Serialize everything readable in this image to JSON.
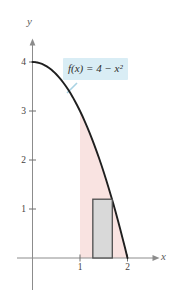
{
  "figure": {
    "function_label": "f(x) = 4 − x²",
    "axis_labels": {
      "x": "x",
      "y": "y"
    }
  },
  "chart_data": {
    "type": "line",
    "title": "",
    "xlabel": "x",
    "ylabel": "y",
    "function_label": "f(x) = 4 − x²",
    "function_coefficients": {
      "a": -1,
      "b": 0,
      "c": 4
    },
    "curve_domain": [
      0,
      2
    ],
    "curve_points": [
      [
        0,
        4
      ],
      [
        0.2,
        3.96
      ],
      [
        0.4,
        3.84
      ],
      [
        0.6,
        3.64
      ],
      [
        0.8,
        3.36
      ],
      [
        1.0,
        3.0
      ],
      [
        1.2,
        2.56
      ],
      [
        1.4,
        2.04
      ],
      [
        1.6,
        1.44
      ],
      [
        1.8,
        0.76
      ],
      [
        2.0,
        0
      ]
    ],
    "x_ticks": [
      1,
      2
    ],
    "y_ticks": [
      1,
      2,
      3,
      4
    ],
    "x_range": [
      -0.35,
      2.65
    ],
    "y_range": [
      -0.8,
      4.55
    ],
    "grid": false,
    "legend": "none",
    "shaded_region": {
      "x_from": 1,
      "x_to": 2,
      "bounded_by": "curve above, x-axis below, line x = 1 at left"
    },
    "rectangle": {
      "x_from": 1.27,
      "x_to": 1.68,
      "height": 1.2
    },
    "colors": {
      "curve": "#1f1f1f",
      "axis": "#8c8c8c",
      "tick": "#6f6f6f",
      "region_fill": "#f9e3e1",
      "rect_fill": "#d9d9d9",
      "rect_stroke": "#4d4d4d",
      "label_bg": "#d9edf5",
      "leader": "#a9d3e3"
    }
  }
}
